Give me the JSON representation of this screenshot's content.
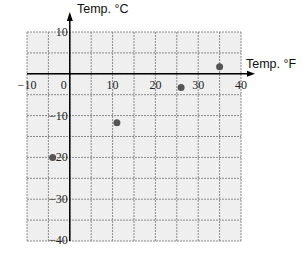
{
  "chart_data": {
    "type": "scatter",
    "title": "",
    "xlabel": "Temp. °F",
    "ylabel": "Temp.  °C",
    "xlim": [
      -10,
      40
    ],
    "ylim": [
      -40,
      10
    ],
    "grid": true,
    "grid_step": {
      "x": 5,
      "y": 5
    },
    "x_tick_labels": [
      "-10",
      "0",
      "10",
      "20",
      "30",
      "40"
    ],
    "x_tick_values": [
      -10,
      0,
      10,
      20,
      30,
      40
    ],
    "y_tick_labels": [
      "10",
      "-10",
      "-20",
      "-30",
      "-40"
    ],
    "y_tick_values": [
      10,
      -10,
      -20,
      -30,
      -40
    ],
    "series": [
      {
        "name": "points",
        "points": [
          {
            "x": -4,
            "y": -20
          },
          {
            "x": 11,
            "y": -11.7
          },
          {
            "x": 26,
            "y": -3.3
          },
          {
            "x": 35,
            "y": 1.7
          }
        ]
      }
    ],
    "legend": null
  },
  "colors": {
    "plot_background": "#efefef",
    "grid_line": "#8a8a8a",
    "axis": "#000000",
    "point": "#555555"
  }
}
